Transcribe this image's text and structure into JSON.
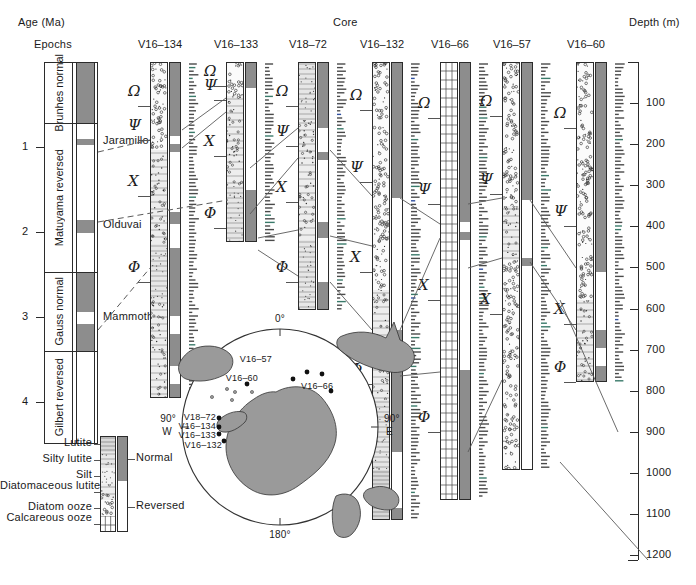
{
  "figure": {
    "age_axis_label": "Age (Ma)",
    "epochs_label": "Epochs",
    "core_label": "Core",
    "depth_axis_label": "Depth (m)"
  },
  "age_scale": {
    "unit": "Ma",
    "ticks": [
      "1",
      "2",
      "3",
      "4"
    ],
    "tick_values": [
      1,
      2,
      3,
      4
    ],
    "range": [
      0,
      4.5
    ]
  },
  "epochs": [
    {
      "name": "Brunhes",
      "polarity_word": "normal",
      "polarity": "normal",
      "top_ma": 0.0,
      "base_ma": 0.72
    },
    {
      "name": "Matuyama",
      "polarity_word": "reversed",
      "polarity": "reversed",
      "top_ma": 0.72,
      "base_ma": 2.47
    },
    {
      "name": "Gauss",
      "polarity_word": "normal",
      "polarity": "normal",
      "top_ma": 2.47,
      "base_ma": 3.4
    },
    {
      "name": "Gilbert",
      "polarity_word": "reversed",
      "polarity": "reversed",
      "top_ma": 3.4,
      "base_ma": 4.5
    }
  ],
  "subchrons": [
    {
      "name": "Jaramillo",
      "top_ma": 0.91,
      "base_ma": 0.98,
      "polarity": "normal"
    },
    {
      "name": "Olduvai",
      "top_ma": 1.86,
      "base_ma": 2.01,
      "polarity": "normal"
    },
    {
      "name": "Mammoth",
      "top_ma": 2.94,
      "base_ma": 3.09,
      "polarity": "reversed"
    }
  ],
  "depth_scale": {
    "unit": "m",
    "ticks": [
      "100",
      "200",
      "300",
      "400",
      "500",
      "600",
      "700",
      "800",
      "900",
      "1000",
      "1100",
      "1200"
    ],
    "tick_values": [
      100,
      200,
      300,
      400,
      500,
      600,
      700,
      800,
      900,
      1000,
      1100,
      1200
    ]
  },
  "datum_markers": [
    "Ω",
    "Ψ",
    "Χ",
    "Φ"
  ],
  "cores": [
    {
      "name": "V16–134",
      "x": 150,
      "top": 62,
      "bottom": 398,
      "markers": [
        {
          "symbol": "Ω",
          "y": 92
        },
        {
          "symbol": "Ψ",
          "y": 126
        },
        {
          "symbol": "Χ",
          "y": 182
        },
        {
          "symbol": "Φ",
          "y": 268
        }
      ],
      "polarity_zones": [
        {
          "type": "normal",
          "top": 62,
          "bottom": 136
        },
        {
          "type": "reversed",
          "top": 136,
          "bottom": 144
        },
        {
          "type": "normal",
          "top": 144,
          "bottom": 152
        },
        {
          "type": "reversed",
          "top": 152,
          "bottom": 212
        },
        {
          "type": "normal",
          "top": 212,
          "bottom": 224
        },
        {
          "type": "reversed",
          "top": 224,
          "bottom": 248
        },
        {
          "type": "normal",
          "top": 248,
          "bottom": 316
        },
        {
          "type": "reversed",
          "top": 316,
          "bottom": 334
        },
        {
          "type": "normal",
          "top": 334,
          "bottom": 366
        },
        {
          "type": "reversed",
          "top": 366,
          "bottom": 384
        },
        {
          "type": "normal",
          "top": 384,
          "bottom": 398
        }
      ],
      "lithology": [
        {
          "type": "diatom-ooze",
          "top": 62,
          "bottom": 150
        },
        {
          "type": "diatomaceous-lutite",
          "top": 150,
          "bottom": 244
        },
        {
          "type": "silty-lutite",
          "top": 244,
          "bottom": 300
        },
        {
          "type": "diatomaceous-lutite",
          "top": 300,
          "bottom": 398
        }
      ]
    },
    {
      "name": "V16–133",
      "x": 226,
      "top": 62,
      "bottom": 242,
      "markers": [
        {
          "symbol": "Ω",
          "y": 72
        },
        {
          "symbol": "Ψ",
          "y": 86
        },
        {
          "symbol": "Χ",
          "y": 142
        },
        {
          "symbol": "Φ",
          "y": 214
        }
      ],
      "polarity_zones": [
        {
          "type": "normal",
          "top": 62,
          "bottom": 88
        },
        {
          "type": "reversed",
          "top": 88,
          "bottom": 190
        },
        {
          "type": "normal",
          "top": 190,
          "bottom": 242
        }
      ],
      "lithology": [
        {
          "type": "diatom-ooze",
          "top": 62,
          "bottom": 96
        },
        {
          "type": "diatomaceous-lutite",
          "top": 96,
          "bottom": 186
        },
        {
          "type": "silty-lutite",
          "top": 186,
          "bottom": 242
        }
      ]
    },
    {
      "name": "V18–72",
      "x": 298,
      "top": 62,
      "bottom": 310,
      "markers": [
        {
          "symbol": "Ω",
          "y": 92
        },
        {
          "symbol": "Ψ",
          "y": 132
        },
        {
          "symbol": "Χ",
          "y": 188
        },
        {
          "symbol": "Φ",
          "y": 268
        }
      ],
      "polarity_zones": [
        {
          "type": "normal",
          "top": 62,
          "bottom": 128
        },
        {
          "type": "reversed",
          "top": 128,
          "bottom": 152
        },
        {
          "type": "normal",
          "top": 152,
          "bottom": 160
        },
        {
          "type": "reversed",
          "top": 160,
          "bottom": 222
        },
        {
          "type": "normal",
          "top": 222,
          "bottom": 238
        },
        {
          "type": "reversed",
          "top": 238,
          "bottom": 282
        },
        {
          "type": "normal",
          "top": 282,
          "bottom": 310
        }
      ],
      "lithology": [
        {
          "type": "silty-lutite",
          "top": 62,
          "bottom": 120
        },
        {
          "type": "diatomaceous-lutite",
          "top": 120,
          "bottom": 240
        },
        {
          "type": "silty-lutite",
          "top": 240,
          "bottom": 310
        }
      ]
    },
    {
      "name": "V16–132",
      "x": 372,
      "top": 62,
      "bottom": 520,
      "markers": [
        {
          "symbol": "Ω",
          "y": 96
        },
        {
          "symbol": "Ψ",
          "y": 168
        },
        {
          "symbol": "Χ",
          "y": 258
        },
        {
          "symbol": "Φ",
          "y": 370
        }
      ],
      "polarity_zones": [
        {
          "type": "normal",
          "top": 62,
          "bottom": 198
        },
        {
          "type": "reversed",
          "top": 198,
          "bottom": 330
        },
        {
          "type": "normal",
          "top": 330,
          "bottom": 452
        },
        {
          "type": "reversed",
          "top": 452,
          "bottom": 508
        },
        {
          "type": "normal",
          "top": 508,
          "bottom": 520
        }
      ],
      "lithology": [
        {
          "type": "diatom-ooze",
          "top": 62,
          "bottom": 290
        },
        {
          "type": "diatomaceous-lutite",
          "top": 290,
          "bottom": 400
        },
        {
          "type": "silty-lutite",
          "top": 400,
          "bottom": 470
        },
        {
          "type": "lutite",
          "top": 470,
          "bottom": 520
        }
      ]
    },
    {
      "name": "V16–66",
      "x": 440,
      "top": 62,
      "bottom": 500,
      "markers": [
        {
          "symbol": "Ω",
          "y": 104
        },
        {
          "symbol": "Ψ",
          "y": 190
        },
        {
          "symbol": "Χ",
          "y": 286
        },
        {
          "symbol": "Φ",
          "y": 418
        }
      ],
      "polarity_zones": [
        {
          "type": "normal",
          "top": 62,
          "bottom": 222
        },
        {
          "type": "reversed",
          "top": 222,
          "bottom": 232
        },
        {
          "type": "normal",
          "top": 232,
          "bottom": 240
        },
        {
          "type": "reversed",
          "top": 240,
          "bottom": 370
        },
        {
          "type": "normal",
          "top": 370,
          "bottom": 500
        }
      ],
      "lithology": [
        {
          "type": "calcareous-ooze",
          "top": 62,
          "bottom": 500
        }
      ]
    },
    {
      "name": "V16–57",
      "x": 502,
      "top": 62,
      "bottom": 470,
      "markers": [
        {
          "symbol": "Ω",
          "y": 102
        },
        {
          "symbol": "Ψ",
          "y": 180
        },
        {
          "symbol": "Χ",
          "y": 300
        }
      ],
      "polarity_zones": [
        {
          "type": "normal",
          "top": 62,
          "bottom": 200
        },
        {
          "type": "reversed",
          "top": 200,
          "bottom": 258
        },
        {
          "type": "normal",
          "top": 258,
          "bottom": 266
        },
        {
          "type": "reversed",
          "top": 266,
          "bottom": 470
        }
      ],
      "lithology": [
        {
          "type": "diatom-ooze",
          "top": 62,
          "bottom": 206
        },
        {
          "type": "diatomaceous-lutite",
          "top": 206,
          "bottom": 260
        },
        {
          "type": "diatom-ooze",
          "top": 260,
          "bottom": 470
        }
      ]
    },
    {
      "name": "V16–60",
      "x": 576,
      "top": 62,
      "bottom": 382,
      "markers": [
        {
          "symbol": "Ω",
          "y": 114
        },
        {
          "symbol": "Ψ",
          "y": 212
        },
        {
          "symbol": "Χ",
          "y": 310
        },
        {
          "symbol": "Φ",
          "y": 368
        }
      ],
      "polarity_zones": [
        {
          "type": "normal",
          "top": 62,
          "bottom": 272
        },
        {
          "type": "reversed",
          "top": 272,
          "bottom": 330
        },
        {
          "type": "normal",
          "top": 330,
          "bottom": 348
        },
        {
          "type": "reversed",
          "top": 348,
          "bottom": 366
        },
        {
          "type": "normal",
          "top": 366,
          "bottom": 382
        }
      ],
      "lithology": [
        {
          "type": "diatom-ooze",
          "top": 62,
          "bottom": 300
        },
        {
          "type": "diatomaceous-lutite",
          "top": 300,
          "bottom": 382
        }
      ]
    }
  ],
  "lithology_legend": {
    "items": [
      {
        "label": "Lutite",
        "type": "lutite"
      },
      {
        "label": "Silty lutite",
        "type": "silty-lutite"
      },
      {
        "label": "Silt",
        "type": "silt"
      },
      {
        "label": "Diatomaceous lutite",
        "type": "diatomaceous-lutite"
      },
      {
        "label": "Diatom ooze",
        "type": "diatom-ooze"
      },
      {
        "label": "Calcareous ooze",
        "type": "calcareous-ooze"
      }
    ],
    "polarity_labels": [
      {
        "label": "Normal",
        "type": "normal"
      },
      {
        "label": "Reversed",
        "type": "reversed"
      }
    ]
  },
  "map": {
    "bearings": {
      "top": "0°",
      "right": "90° E",
      "bottom": "180°",
      "left": "90° W"
    },
    "left_label_line1": "90°",
    "left_label_line2": "W",
    "right_label_line1": "90°",
    "right_label_line2": "E",
    "sites": [
      {
        "name": "V16–57",
        "lx": 272,
        "ly": 360,
        "px": 307,
        "py": 372,
        "anchor": "end"
      },
      {
        "name": "V16–60",
        "lx": 258,
        "ly": 379,
        "px": 293,
        "py": 379,
        "anchor": "end"
      },
      {
        "name": "V16–66",
        "lx": 301,
        "ly": 387,
        "px": 322,
        "py": 374,
        "anchor": "start"
      },
      {
        "name": "V18–72",
        "lx": 216,
        "ly": 418,
        "px": 219,
        "py": 418,
        "anchor": "end"
      },
      {
        "name": "V16–134",
        "lx": 216,
        "ly": 427,
        "px": 219,
        "py": 427,
        "anchor": "end"
      },
      {
        "name": "V16–133",
        "lx": 216,
        "ly": 436,
        "px": 219,
        "py": 434,
        "anchor": "end"
      },
      {
        "name": "V16–132",
        "lx": 222,
        "ly": 446,
        "px": 224,
        "py": 441,
        "anchor": "end"
      }
    ],
    "extra_dots": [
      {
        "px": 307,
        "py": 372
      },
      {
        "px": 293,
        "py": 379
      },
      {
        "px": 322,
        "py": 374
      },
      {
        "px": 331,
        "py": 391
      },
      {
        "px": 247,
        "py": 384
      },
      {
        "px": 219,
        "py": 418
      },
      {
        "px": 219,
        "py": 427
      },
      {
        "px": 219,
        "py": 434
      },
      {
        "px": 224,
        "py": 441
      }
    ]
  },
  "colors": {
    "normal_fill": "#8d8d8d",
    "reversed_fill": "#ffffff",
    "outline": "#2b2b2b",
    "land_fill": "#9a9a9a",
    "correlation_line": "#5a5a5a",
    "tick": "#555555"
  }
}
